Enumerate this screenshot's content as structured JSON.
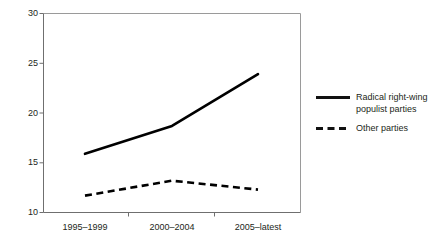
{
  "chart_data": {
    "type": "line",
    "title": "",
    "subtitle": "",
    "xlabel": "",
    "ylabel": "",
    "categories": [
      "1995–1999",
      "2000–2004",
      "2005–latest"
    ],
    "series": [
      {
        "name": "Radical right-wing\npopulist parties",
        "style": "solid",
        "color": "#000000",
        "values": [
          15.9,
          18.7,
          23.9
        ]
      },
      {
        "name": "Other parties",
        "style": "dashed",
        "color": "#000000",
        "values": [
          11.7,
          13.2,
          12.3
        ]
      }
    ],
    "ylim": [
      10,
      30
    ],
    "yticks": [
      10,
      15,
      20,
      25,
      30
    ],
    "ytick_labels": [
      "10",
      "15",
      "20",
      "25",
      "30"
    ],
    "grid": false,
    "legend_position": "right"
  },
  "axes": {
    "y": {
      "t0": "30",
      "t1": "25",
      "t2": "20",
      "t3": "15",
      "t4": "10"
    },
    "x": {
      "t0": "1995–1999",
      "t1": "2000–2004",
      "t2": "2005–latest"
    }
  },
  "legend": {
    "entry0": "Radical right-wing\npopulist parties",
    "entry1": "Other parties"
  },
  "colors": {
    "line": "#000000",
    "axis": "#8b8b8b",
    "text": "#231f20",
    "background": "#ffffff"
  }
}
